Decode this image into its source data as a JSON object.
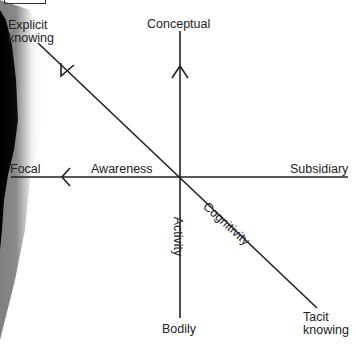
{
  "diagram": {
    "labels": {
      "explicit": "Explicit\nknowing",
      "explicit_l1": "Explicit",
      "explicit_l2": "knowing",
      "conceptual": "Conceptual",
      "focal": "Focal",
      "awareness": "Awareness",
      "subsidiary": "Subsidiary",
      "activity": "Activity",
      "cognitivity": "Cognitivity",
      "bodily": "Bodily",
      "tacit_l1": "Tacit",
      "tacit_l2": "knowing"
    },
    "axes": [
      {
        "name": "vertical",
        "from": "Bodily",
        "to": "Conceptual",
        "label": "Activity"
      },
      {
        "name": "horizontal",
        "from": "Subsidiary",
        "to": "Focal",
        "label": "Awareness"
      },
      {
        "name": "diagonal",
        "from": "Tacit knowing",
        "to": "Explicit knowing",
        "label": "Cognitivity"
      }
    ],
    "colors": {
      "line": "#222222",
      "background": "#ffffff"
    }
  }
}
